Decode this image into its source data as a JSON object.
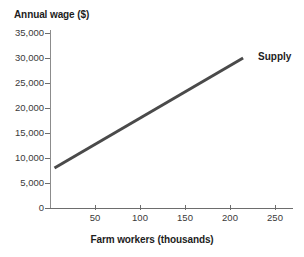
{
  "chart_data": {
    "type": "line",
    "title": "",
    "xlabel": "Farm workers (thousands)",
    "ylabel": "Annual wage ($)",
    "xlim": [
      0,
      265
    ],
    "ylim": [
      0,
      35000
    ],
    "grid": false,
    "legend_position": "inline-right",
    "x_ticks": [
      {
        "value": 50,
        "label": "50"
      },
      {
        "value": 100,
        "label": "100"
      },
      {
        "value": 150,
        "label": "150"
      },
      {
        "value": 200,
        "label": "200"
      },
      {
        "value": 250,
        "label": "250"
      }
    ],
    "y_ticks": [
      {
        "value": 0,
        "label": "0"
      },
      {
        "value": 5000,
        "label": "5,000"
      },
      {
        "value": 10000,
        "label": "10,000"
      },
      {
        "value": 15000,
        "label": "15,000"
      },
      {
        "value": 20000,
        "label": "20,000"
      },
      {
        "value": 25000,
        "label": "25,000"
      },
      {
        "value": 30000,
        "label": "30,000"
      },
      {
        "value": 35000,
        "label": "35,000"
      }
    ],
    "series": [
      {
        "name": "Supply",
        "color": "#4a4a4a",
        "annotation": "Supply",
        "x": [
          5,
          215
        ],
        "values": [
          8000,
          30000
        ],
        "points": [
          {
            "x": 5,
            "y": 8000
          },
          {
            "x": 215,
            "y": 30000
          }
        ]
      }
    ]
  },
  "axes": {
    "y_title": "Annual wage ($)",
    "x_title": "Farm workers (thousands)"
  },
  "colors": {
    "line": "#4a4a4a",
    "axis": "#6d6d6d",
    "text": "#1d1d1d",
    "tick_text": "#3a3a3a",
    "background": "#ffffff"
  }
}
